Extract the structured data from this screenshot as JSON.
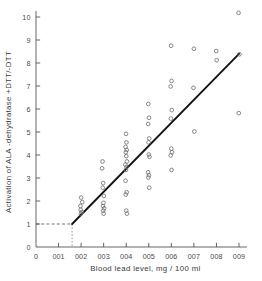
{
  "chart_data": {
    "type": "scatter",
    "title": "",
    "subtitle": "",
    "xlabel": "Blood  lead level,   mg / 100 ml",
    "ylabel": "Activation of  ALA -dehydratase +DTT/-DTT",
    "xlim": [
      0,
      0.095
    ],
    "ylim": [
      0,
      10.6
    ],
    "grid": false,
    "legend": null,
    "marker_style": "open-circle",
    "xticks": [
      0,
      0.01,
      0.02,
      0.03,
      0.04,
      0.05,
      0.06,
      0.07,
      0.08,
      0.09
    ],
    "xticklabels": [
      "0",
      "001",
      "002",
      "003",
      "004",
      "005",
      "006",
      "007",
      "008",
      "009"
    ],
    "yticks": [
      0,
      1,
      2,
      3,
      4,
      5,
      6,
      7,
      8,
      9,
      10
    ],
    "yticklabels": [
      "0",
      "1",
      "2",
      "3",
      "4",
      "5",
      "6",
      "7",
      "8",
      "9",
      "10"
    ],
    "points": [
      {
        "x": 0.02,
        "y": 2.15
      },
      {
        "x": 0.0205,
        "y": 1.95
      },
      {
        "x": 0.0197,
        "y": 1.78
      },
      {
        "x": 0.0198,
        "y": 1.62
      },
      {
        "x": 0.0203,
        "y": 1.52
      },
      {
        "x": 0.0199,
        "y": 1.45
      },
      {
        "x": 0.0295,
        "y": 3.72
      },
      {
        "x": 0.0293,
        "y": 3.42
      },
      {
        "x": 0.0298,
        "y": 2.78
      },
      {
        "x": 0.0296,
        "y": 2.58
      },
      {
        "x": 0.0301,
        "y": 2.22
      },
      {
        "x": 0.0299,
        "y": 1.92
      },
      {
        "x": 0.0297,
        "y": 1.78
      },
      {
        "x": 0.0302,
        "y": 1.68
      },
      {
        "x": 0.0298,
        "y": 1.58
      },
      {
        "x": 0.03,
        "y": 1.45
      },
      {
        "x": 0.0399,
        "y": 4.92
      },
      {
        "x": 0.0401,
        "y": 4.55
      },
      {
        "x": 0.0397,
        "y": 4.35
      },
      {
        "x": 0.0402,
        "y": 4.22
      },
      {
        "x": 0.0398,
        "y": 4.12
      },
      {
        "x": 0.04,
        "y": 3.95
      },
      {
        "x": 0.0403,
        "y": 3.72
      },
      {
        "x": 0.0396,
        "y": 3.58
      },
      {
        "x": 0.0401,
        "y": 3.48
      },
      {
        "x": 0.0399,
        "y": 3.35
      },
      {
        "x": 0.0397,
        "y": 2.88
      },
      {
        "x": 0.0402,
        "y": 2.38
      },
      {
        "x": 0.0398,
        "y": 2.28
      },
      {
        "x": 0.04,
        "y": 1.58
      },
      {
        "x": 0.0403,
        "y": 1.45
      },
      {
        "x": 0.0498,
        "y": 6.22
      },
      {
        "x": 0.0501,
        "y": 5.62
      },
      {
        "x": 0.0497,
        "y": 5.35
      },
      {
        "x": 0.0502,
        "y": 4.72
      },
      {
        "x": 0.0499,
        "y": 4.55
      },
      {
        "x": 0.05,
        "y": 4.02
      },
      {
        "x": 0.0503,
        "y": 3.92
      },
      {
        "x": 0.0497,
        "y": 3.25
      },
      {
        "x": 0.0501,
        "y": 3.12
      },
      {
        "x": 0.0498,
        "y": 3.02
      },
      {
        "x": 0.0502,
        "y": 2.58
      },
      {
        "x": 0.0599,
        "y": 8.75
      },
      {
        "x": 0.0601,
        "y": 7.22
      },
      {
        "x": 0.0597,
        "y": 6.98
      },
      {
        "x": 0.0602,
        "y": 5.95
      },
      {
        "x": 0.0598,
        "y": 5.58
      },
      {
        "x": 0.06,
        "y": 4.28
      },
      {
        "x": 0.0603,
        "y": 4.12
      },
      {
        "x": 0.0597,
        "y": 3.98
      },
      {
        "x": 0.0601,
        "y": 3.35
      },
      {
        "x": 0.07,
        "y": 8.62
      },
      {
        "x": 0.0698,
        "y": 6.92
      },
      {
        "x": 0.0702,
        "y": 5.02
      },
      {
        "x": 0.0799,
        "y": 8.52
      },
      {
        "x": 0.0801,
        "y": 8.12
      },
      {
        "x": 0.0898,
        "y": 10.18
      },
      {
        "x": 0.0902,
        "y": 8.38
      },
      {
        "x": 0.0899,
        "y": 5.82
      }
    ],
    "fit_line": {
      "type": "linear-fit",
      "x_start": 0.016,
      "y_start": 1.0,
      "x_end": 0.09,
      "y_end": 8.4
    },
    "threshold_guides": {
      "horizontal_dashed_y": 1.0,
      "horizontal_dashed_x_from": 0.0,
      "horizontal_dashed_x_to": 0.016,
      "vertical_dotted_x": 0.016,
      "vertical_dotted_y_from": 0.0,
      "vertical_dotted_y_to": 1.0
    }
  }
}
